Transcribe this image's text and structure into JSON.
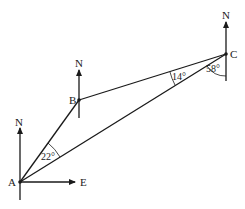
{
  "diagram": {
    "type": "bearing-triangle",
    "points": {
      "A": {
        "label": "A"
      },
      "B": {
        "label": "B"
      },
      "C": {
        "label": "C"
      }
    },
    "north_label": "N",
    "east_label": "E",
    "angles": {
      "at_A": "22°",
      "at_C_between_CB_CA": "14°",
      "at_C_from_south": "58°"
    },
    "colors": {
      "ink": "#1a1a1a",
      "background": "#ffffff"
    }
  }
}
